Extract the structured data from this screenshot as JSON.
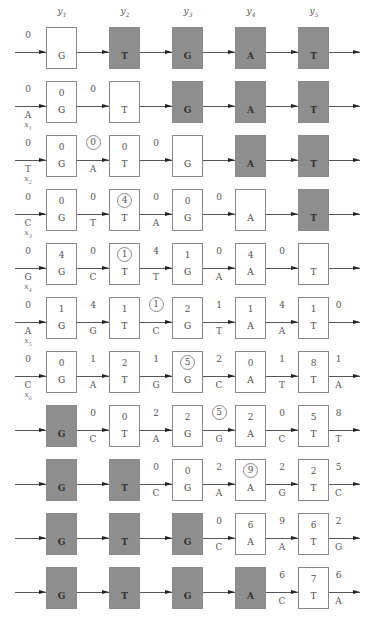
{
  "headers": [
    {
      "sym": "y",
      "sub": "1"
    },
    {
      "sym": "y",
      "sub": "2"
    },
    {
      "sym": "y",
      "sub": "3"
    },
    {
      "sym": "y",
      "sub": "4"
    },
    {
      "sym": "y",
      "sub": "5"
    }
  ],
  "colors": {
    "shaded": "#9c9c9c",
    "border": "#888888",
    "line": "#555555"
  },
  "rows": [
    {
      "input": {
        "top": "0",
        "bottom": "",
        "xsym": "",
        "xsub": ""
      },
      "boxes": [
        {
          "state": "white",
          "top": "",
          "bottom": "G",
          "circled": false
        },
        {
          "state": "shaded",
          "top": "",
          "bottom": "T",
          "circled": false
        },
        {
          "state": "shaded",
          "top": "",
          "bottom": "G",
          "circled": false
        },
        {
          "state": "shaded",
          "top": "",
          "bottom": "A",
          "circled": false
        },
        {
          "state": "shaded",
          "top": "",
          "bottom": "T",
          "circled": false
        }
      ],
      "edges": [
        {
          "top": "",
          "bottom": "",
          "circled": false
        },
        {
          "top": "",
          "bottom": "",
          "circled": false
        },
        {
          "top": "",
          "bottom": "",
          "circled": false
        },
        {
          "top": "",
          "bottom": "",
          "circled": false
        },
        {
          "top": "",
          "bottom": "",
          "circled": false
        }
      ]
    },
    {
      "input": {
        "top": "0",
        "bottom": "A",
        "xsym": "x",
        "xsub": "1"
      },
      "boxes": [
        {
          "state": "white",
          "top": "0",
          "bottom": "G",
          "circled": false
        },
        {
          "state": "white",
          "top": "",
          "bottom": "T",
          "circled": false
        },
        {
          "state": "shaded",
          "top": "",
          "bottom": "G",
          "circled": false
        },
        {
          "state": "shaded",
          "top": "",
          "bottom": "A",
          "circled": false
        },
        {
          "state": "shaded",
          "top": "",
          "bottom": "T",
          "circled": false
        }
      ],
      "edges": [
        {
          "top": "0",
          "bottom": "",
          "circled": false
        },
        {
          "top": "",
          "bottom": "",
          "circled": false
        },
        {
          "top": "",
          "bottom": "",
          "circled": false
        },
        {
          "top": "",
          "bottom": "",
          "circled": false
        },
        {
          "top": "",
          "bottom": "",
          "circled": false
        }
      ]
    },
    {
      "input": {
        "top": "0",
        "bottom": "T",
        "xsym": "x",
        "xsub": "2"
      },
      "boxes": [
        {
          "state": "white",
          "top": "0",
          "bottom": "G",
          "circled": false
        },
        {
          "state": "white",
          "top": "0",
          "bottom": "T",
          "circled": false
        },
        {
          "state": "white",
          "top": "",
          "bottom": "G",
          "circled": false
        },
        {
          "state": "shaded",
          "top": "",
          "bottom": "A",
          "circled": false
        },
        {
          "state": "shaded",
          "top": "",
          "bottom": "T",
          "circled": false
        }
      ],
      "edges": [
        {
          "top": "0",
          "bottom": "A",
          "circled": true
        },
        {
          "top": "0",
          "bottom": "",
          "circled": false
        },
        {
          "top": "",
          "bottom": "",
          "circled": false
        },
        {
          "top": "",
          "bottom": "",
          "circled": false
        },
        {
          "top": "",
          "bottom": "",
          "circled": false
        }
      ]
    },
    {
      "input": {
        "top": "0",
        "bottom": "C",
        "xsym": "x",
        "xsub": "3"
      },
      "boxes": [
        {
          "state": "white",
          "top": "0",
          "bottom": "G",
          "circled": false
        },
        {
          "state": "white",
          "top": "4",
          "bottom": "T",
          "circled": true
        },
        {
          "state": "white",
          "top": "0",
          "bottom": "G",
          "circled": false
        },
        {
          "state": "white",
          "top": "",
          "bottom": "A",
          "circled": false
        },
        {
          "state": "shaded",
          "top": "",
          "bottom": "T",
          "circled": false
        }
      ],
      "edges": [
        {
          "top": "0",
          "bottom": "T",
          "circled": false
        },
        {
          "top": "0",
          "bottom": "A",
          "circled": false
        },
        {
          "top": "0",
          "bottom": "",
          "circled": false
        },
        {
          "top": "",
          "bottom": "",
          "circled": false
        },
        {
          "top": "",
          "bottom": "",
          "circled": false
        }
      ]
    },
    {
      "input": {
        "top": "0",
        "bottom": "G",
        "xsym": "x",
        "xsub": "4"
      },
      "boxes": [
        {
          "state": "white",
          "top": "4",
          "bottom": "G",
          "circled": false
        },
        {
          "state": "white",
          "top": "1",
          "bottom": "T",
          "circled": true
        },
        {
          "state": "white",
          "top": "1",
          "bottom": "G",
          "circled": false
        },
        {
          "state": "white",
          "top": "4",
          "bottom": "A",
          "circled": false
        },
        {
          "state": "white",
          "top": "",
          "bottom": "T",
          "circled": false
        }
      ],
      "edges": [
        {
          "top": "0",
          "bottom": "C",
          "circled": false
        },
        {
          "top": "4",
          "bottom": "T",
          "circled": false
        },
        {
          "top": "0",
          "bottom": "A",
          "circled": false
        },
        {
          "top": "0",
          "bottom": "",
          "circled": false
        },
        {
          "top": "",
          "bottom": "",
          "circled": false
        }
      ]
    },
    {
      "input": {
        "top": "0",
        "bottom": "A",
        "xsym": "x",
        "xsub": "5"
      },
      "boxes": [
        {
          "state": "white",
          "top": "1",
          "bottom": "G",
          "circled": false
        },
        {
          "state": "white",
          "top": "1",
          "bottom": "T",
          "circled": false
        },
        {
          "state": "white",
          "top": "2",
          "bottom": "G",
          "circled": false
        },
        {
          "state": "white",
          "top": "1",
          "bottom": "A",
          "circled": false
        },
        {
          "state": "white",
          "top": "1",
          "bottom": "T",
          "circled": false
        }
      ],
      "edges": [
        {
          "top": "4",
          "bottom": "G",
          "circled": false
        },
        {
          "top": "1",
          "bottom": "C",
          "circled": true
        },
        {
          "top": "1",
          "bottom": "T",
          "circled": false
        },
        {
          "top": "4",
          "bottom": "A",
          "circled": false
        },
        {
          "top": "0",
          "bottom": "",
          "circled": false
        }
      ]
    },
    {
      "input": {
        "top": "0",
        "bottom": "C",
        "xsym": "x",
        "xsub": "6"
      },
      "boxes": [
        {
          "state": "white",
          "top": "0",
          "bottom": "G",
          "circled": false
        },
        {
          "state": "white",
          "top": "2",
          "bottom": "T",
          "circled": false
        },
        {
          "state": "white",
          "top": "5",
          "bottom": "G",
          "circled": true
        },
        {
          "state": "white",
          "top": "0",
          "bottom": "A",
          "circled": false
        },
        {
          "state": "white",
          "top": "8",
          "bottom": "T",
          "circled": false
        }
      ],
      "edges": [
        {
          "top": "1",
          "bottom": "A",
          "circled": false
        },
        {
          "top": "1",
          "bottom": "G",
          "circled": false
        },
        {
          "top": "2",
          "bottom": "C",
          "circled": false
        },
        {
          "top": "1",
          "bottom": "T",
          "circled": false
        },
        {
          "top": "1",
          "bottom": "A",
          "circled": false
        }
      ]
    },
    {
      "input": {
        "top": "",
        "bottom": "",
        "xsym": "",
        "xsub": ""
      },
      "boxes": [
        {
          "state": "shaded",
          "top": "",
          "bottom": "G",
          "circled": false
        },
        {
          "state": "white",
          "top": "0",
          "bottom": "T",
          "circled": false
        },
        {
          "state": "white",
          "top": "2",
          "bottom": "G",
          "circled": false
        },
        {
          "state": "white",
          "top": "2",
          "bottom": "A",
          "circled": false
        },
        {
          "state": "white",
          "top": "5",
          "bottom": "T",
          "circled": false
        }
      ],
      "edges": [
        {
          "top": "0",
          "bottom": "C",
          "circled": false
        },
        {
          "top": "2",
          "bottom": "A",
          "circled": false
        },
        {
          "top": "5",
          "bottom": "G",
          "circled": true
        },
        {
          "top": "0",
          "bottom": "C",
          "circled": false
        },
        {
          "top": "8",
          "bottom": "T",
          "circled": false
        }
      ]
    },
    {
      "input": {
        "top": "",
        "bottom": "",
        "xsym": "",
        "xsub": ""
      },
      "boxes": [
        {
          "state": "shaded",
          "top": "",
          "bottom": "G",
          "circled": false
        },
        {
          "state": "shaded",
          "top": "",
          "bottom": "T",
          "circled": false
        },
        {
          "state": "white",
          "top": "0",
          "bottom": "G",
          "circled": false
        },
        {
          "state": "white",
          "top": "9",
          "bottom": "A",
          "circled": true
        },
        {
          "state": "white",
          "top": "2",
          "bottom": "T",
          "circled": false
        }
      ],
      "edges": [
        {
          "top": "",
          "bottom": "",
          "circled": false
        },
        {
          "top": "0",
          "bottom": "C",
          "circled": false
        },
        {
          "top": "2",
          "bottom": "A",
          "circled": false
        },
        {
          "top": "2",
          "bottom": "G",
          "circled": false
        },
        {
          "top": "5",
          "bottom": "C",
          "circled": false
        }
      ]
    },
    {
      "input": {
        "top": "",
        "bottom": "",
        "xsym": "",
        "xsub": ""
      },
      "boxes": [
        {
          "state": "shaded",
          "top": "",
          "bottom": "G",
          "circled": false
        },
        {
          "state": "shaded",
          "top": "",
          "bottom": "T",
          "circled": false
        },
        {
          "state": "shaded",
          "top": "",
          "bottom": "G",
          "circled": false
        },
        {
          "state": "white",
          "top": "6",
          "bottom": "A",
          "circled": false
        },
        {
          "state": "white",
          "top": "6",
          "bottom": "T",
          "circled": false
        }
      ],
      "edges": [
        {
          "top": "",
          "bottom": "",
          "circled": false
        },
        {
          "top": "",
          "bottom": "",
          "circled": false
        },
        {
          "top": "0",
          "bottom": "C",
          "circled": false
        },
        {
          "top": "9",
          "bottom": "A",
          "circled": false
        },
        {
          "top": "2",
          "bottom": "G",
          "circled": false
        }
      ]
    },
    {
      "input": {
        "top": "",
        "bottom": "",
        "xsym": "",
        "xsub": ""
      },
      "boxes": [
        {
          "state": "shaded",
          "top": "",
          "bottom": "G",
          "circled": false
        },
        {
          "state": "shaded",
          "top": "",
          "bottom": "T",
          "circled": false
        },
        {
          "state": "shaded",
          "top": "",
          "bottom": "G",
          "circled": false
        },
        {
          "state": "shaded",
          "top": "",
          "bottom": "A",
          "circled": false
        },
        {
          "state": "white",
          "top": "7",
          "bottom": "T",
          "circled": false
        }
      ],
      "edges": [
        {
          "top": "",
          "bottom": "",
          "circled": false
        },
        {
          "top": "",
          "bottom": "",
          "circled": false
        },
        {
          "top": "",
          "bottom": "",
          "circled": false
        },
        {
          "top": "6",
          "bottom": "C",
          "circled": false
        },
        {
          "top": "6",
          "bottom": "A",
          "circled": false
        }
      ]
    }
  ]
}
